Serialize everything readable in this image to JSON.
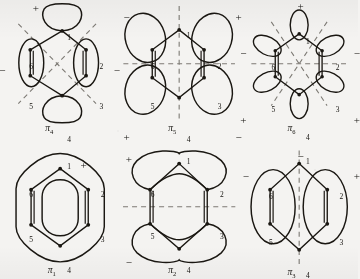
{
  "figure": {
    "ink_color": "#1a1712",
    "dash_color": "#7d7a74",
    "background_color": "#f4f3f1",
    "atom_labels": [
      "1",
      "2",
      "3",
      "4",
      "5",
      "6"
    ]
  },
  "panels": [
    {
      "id": "pi4",
      "name": "π",
      "subscript": "4",
      "row": "top",
      "column": "left",
      "nodal_lines": "two diagonal crossing nodal planes",
      "lobe_style": "four lobes: top oval (atom 1), bottom oval (atom 4), left tall oval (atoms 6,5), right tall oval (atoms 2,3)",
      "signs": [
        {
          "text": "+",
          "x": 30,
          "y": 6
        },
        {
          "text": "−",
          "x": 2,
          "y": 50
        },
        {
          "text": "−",
          "x": 98,
          "y": 50
        },
        {
          "text": "+",
          "x": 70,
          "y": 118
        }
      ],
      "atoms": [
        {
          "label": "1",
          "x": 58,
          "y": 27
        },
        {
          "label": "2",
          "x": 85,
          "y": 48
        },
        {
          "label": "3",
          "x": 85,
          "y": 77
        },
        {
          "label": "4",
          "x": 58,
          "y": 100
        },
        {
          "label": "5",
          "x": 26,
          "y": 77
        },
        {
          "label": "6",
          "x": 26,
          "y": 48
        }
      ]
    },
    {
      "id": "pi5",
      "name": "π",
      "subscript": "5",
      "row": "top",
      "column": "center",
      "nodal_lines": "vertical and horizontal nodal planes",
      "lobe_style": "four large ovals at atoms 6, 2, 5, 3 corners",
      "signs": [
        {
          "text": "−",
          "x": 6,
          "y": 12
        },
        {
          "text": "+",
          "x": 100,
          "y": 12
        },
        {
          "text": "+",
          "x": 6,
          "y": 98
        },
        {
          "text": "−",
          "x": 100,
          "y": 98
        }
      ],
      "atoms": [
        {
          "label": "1",
          "x": 58,
          "y": 26
        },
        {
          "label": "2",
          "x": 84,
          "y": 48
        },
        {
          "label": "3",
          "x": 84,
          "y": 77
        },
        {
          "label": "4",
          "x": 58,
          "y": 100
        },
        {
          "label": "5",
          "x": 28,
          "y": 77
        },
        {
          "label": "6",
          "x": 28,
          "y": 48
        }
      ]
    },
    {
      "id": "pi6",
      "name": "π",
      "subscript": "6",
      "row": "top",
      "column": "right",
      "nodal_lines": "three nodal planes through the ring center",
      "lobe_style": "six small lobes, one per atom, alternating phase",
      "signs": [
        {
          "text": "+",
          "x": 52,
          "y": 4
        },
        {
          "text": "−",
          "x": 4,
          "y": 38
        },
        {
          "text": "−",
          "x": 99,
          "y": 38
        },
        {
          "text": "+",
          "x": 4,
          "y": 86
        },
        {
          "text": "+",
          "x": 99,
          "y": 86
        },
        {
          "text": "−",
          "x": 52,
          "y": 112
        }
      ],
      "atoms": [
        {
          "label": "1",
          "x": 58,
          "y": 30
        },
        {
          "label": "2",
          "x": 83,
          "y": 49
        },
        {
          "label": "3",
          "x": 83,
          "y": 79
        },
        {
          "label": "4",
          "x": 58,
          "y": 99
        },
        {
          "label": "5",
          "x": 29,
          "y": 79
        },
        {
          "label": "6",
          "x": 29,
          "y": 49
        }
      ]
    },
    {
      "id": "pi1",
      "name": "π",
      "subscript": "1",
      "row": "bottom",
      "column": "left",
      "nodal_lines": "none",
      "lobe_style": "continuous inner and outer rings around the whole hexagon",
      "signs": [],
      "atoms": [
        {
          "label": "1",
          "x": 58,
          "y": 20
        },
        {
          "label": "2",
          "x": 86,
          "y": 40
        },
        {
          "label": "3",
          "x": 86,
          "y": 72
        },
        {
          "label": "4",
          "x": 58,
          "y": 94
        },
        {
          "label": "5",
          "x": 26,
          "y": 72
        },
        {
          "label": "6",
          "x": 26,
          "y": 40
        }
      ]
    },
    {
      "id": "pi2",
      "name": "π",
      "subscript": "2",
      "row": "bottom",
      "column": "center",
      "nodal_lines": "one horizontal nodal plane",
      "lobe_style": "two crescent lobes spanning atoms 6-1-2 and 5-4-3",
      "signs": [
        {
          "text": "+",
          "x": 8,
          "y": 14
        },
        {
          "text": "−",
          "x": 8,
          "y": 88
        }
      ],
      "atoms": [
        {
          "label": "1",
          "x": 58,
          "y": 16
        },
        {
          "label": "2",
          "x": 86,
          "y": 40
        },
        {
          "label": "3",
          "x": 86,
          "y": 70
        },
        {
          "label": "4",
          "x": 58,
          "y": 94
        },
        {
          "label": "5",
          "x": 28,
          "y": 70
        },
        {
          "label": "6",
          "x": 28,
          "y": 40
        }
      ]
    },
    {
      "id": "pi3",
      "name": "π",
      "subscript": "3",
      "row": "bottom",
      "column": "right",
      "nodal_lines": "one vertical nodal plane through atoms 1 and 4",
      "lobe_style": "two tall ovals on the left and right sides of the ring",
      "signs": [
        {
          "text": "−",
          "x": 6,
          "y": 26
        },
        {
          "text": "+",
          "x": 99,
          "y": 26
        }
      ],
      "atoms": [
        {
          "label": "1",
          "x": 58,
          "y": 16
        },
        {
          "label": "2",
          "x": 86,
          "y": 41
        },
        {
          "label": "3",
          "x": 86,
          "y": 74
        },
        {
          "label": "4",
          "x": 58,
          "y": 98
        },
        {
          "label": "5",
          "x": 27,
          "y": 74
        },
        {
          "label": "6",
          "x": 27,
          "y": 41
        }
      ]
    }
  ]
}
